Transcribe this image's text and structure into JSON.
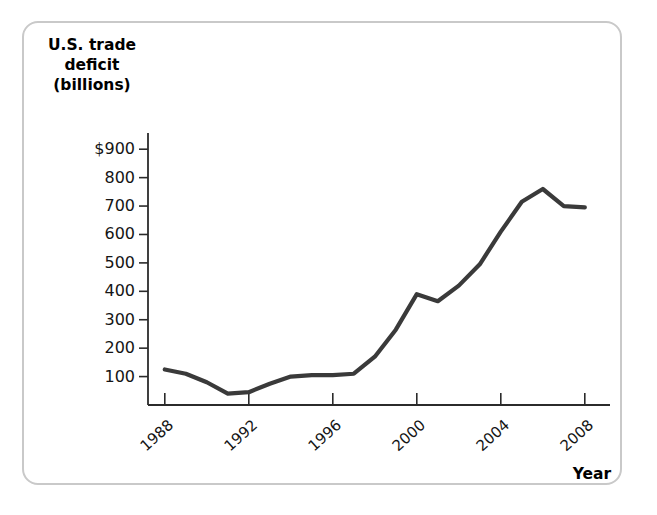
{
  "chart_data": {
    "type": "line",
    "title": "",
    "ylabel": "U.S. trade deficit (billions)",
    "xlabel": "Year",
    "ylabel_lines": [
      "U.S. trade",
      "deficit",
      "(billions)"
    ],
    "grid": false,
    "legend": "none",
    "line_color": "#3a3a3a",
    "frame_color": "#c9c9c9",
    "axis_color": "#2b2b2b",
    "xlim": [
      1987.2,
      2009.2
    ],
    "ylim": [
      0,
      950
    ],
    "ytick_labels": [
      "$900",
      "800",
      "700",
      "600",
      "500",
      "400",
      "300",
      "200",
      "100"
    ],
    "ytick_values": [
      900,
      800,
      700,
      600,
      500,
      400,
      300,
      200,
      100
    ],
    "xtick_labels": [
      "1988",
      "1992",
      "1996",
      "2000",
      "2004",
      "2008"
    ],
    "xtick_values": [
      1988,
      1992,
      1996,
      2000,
      2004,
      2008
    ],
    "x": [
      1988,
      1989,
      1990,
      1991,
      1992,
      1993,
      1994,
      1995,
      1996,
      1997,
      1998,
      1999,
      2000,
      2001,
      2002,
      2003,
      2004,
      2005,
      2006,
      2007,
      2008
    ],
    "values": [
      125,
      110,
      80,
      40,
      45,
      75,
      100,
      105,
      105,
      110,
      170,
      265,
      390,
      365,
      420,
      495,
      610,
      715,
      760,
      700,
      695
    ],
    "series": [
      {
        "name": "U.S. trade deficit",
        "values": [
          125,
          110,
          80,
          40,
          45,
          75,
          100,
          105,
          105,
          110,
          170,
          265,
          390,
          365,
          420,
          495,
          610,
          715,
          760,
          700,
          695
        ]
      }
    ]
  }
}
